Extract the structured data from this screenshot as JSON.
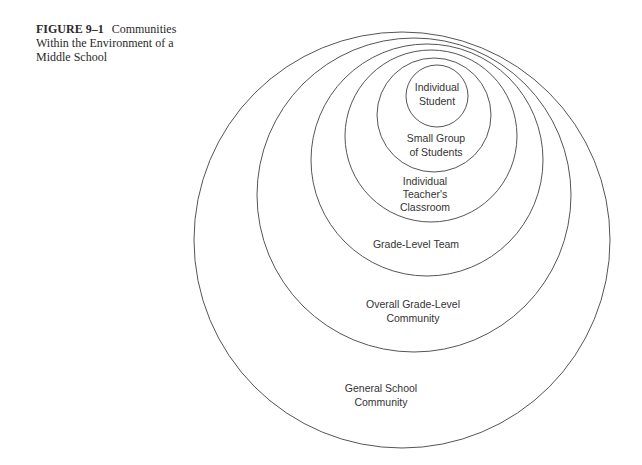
{
  "caption": {
    "figure_label": "FIGURE 9–1",
    "title": "Communities Within the Environment of a Middle School"
  },
  "diagram": {
    "type": "nested-circles",
    "stroke_color": "#555555",
    "circles": [
      {
        "id": "general-school",
        "label_lines": [
          "General School",
          "Community"
        ],
        "cx": 402,
        "cy": 240,
        "r": 208,
        "label_x": 381,
        "label_y": 392
      },
      {
        "id": "overall-grade-level",
        "label_lines": [
          "Overall Grade-Level",
          "Community"
        ],
        "cx": 414,
        "cy": 195,
        "r": 157,
        "label_x": 413,
        "label_y": 308
      },
      {
        "id": "grade-level-team",
        "label_lines": [
          "Grade-Level Team"
        ],
        "cx": 427,
        "cy": 160,
        "r": 116,
        "label_x": 416,
        "label_y": 248
      },
      {
        "id": "teacher-classroom",
        "label_lines": [
          "Individual",
          "Teacher's",
          "Classroom"
        ],
        "cx": 431,
        "cy": 136,
        "r": 86,
        "label_x": 425,
        "label_y": 185
      },
      {
        "id": "small-group",
        "label_lines": [
          "Small Group",
          "of Students"
        ],
        "cx": 434,
        "cy": 115,
        "r": 57,
        "label_x": 436,
        "label_y": 142
      },
      {
        "id": "individual-student",
        "label_lines": [
          "Individual",
          "Student"
        ],
        "cx": 437,
        "cy": 96,
        "r": 31,
        "label_x": 437,
        "label_y": 91
      }
    ]
  }
}
